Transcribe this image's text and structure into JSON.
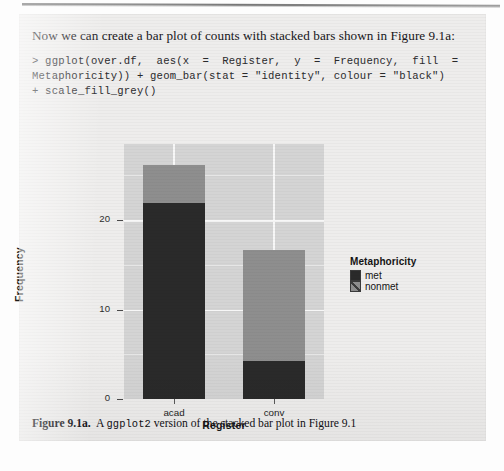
{
  "page": {
    "prose_text": "Now we can create a bar plot of counts with stacked bars shown in Figure 9.1a:",
    "code_lines": [
      "> ggplot(over.df,  aes(x  =  Register,  y  =  Frequency,  fill  =",
      "Metaphoricity)) + geom_bar(stat = \"identity\", colour = \"black\")",
      "+ scale_fill_grey()"
    ],
    "caption": {
      "label": "Figure 9.1a.",
      "text_before": "A ",
      "mono": "ggplot2",
      "text_after": " version of the stacked bar plot in Figure 9.1"
    }
  },
  "chart_data": {
    "type": "bar",
    "stacked": true,
    "title": "",
    "xlabel": "Register",
    "ylabel": "Frequency",
    "categories": [
      "acad",
      "conv"
    ],
    "yticks": [
      0,
      10,
      20
    ],
    "ylim": [
      0,
      28.5
    ],
    "grid": true,
    "legend_title": "Metaphoricity",
    "legend_position": "right",
    "series": [
      {
        "name": "met",
        "values": [
          21.9,
          4.3
        ],
        "color": "#2a2a2a"
      },
      {
        "name": "nonmet",
        "values": [
          4.3,
          12.4
        ],
        "color": "#8e8e8e"
      }
    ],
    "totals": [
      26.2,
      16.7
    ],
    "panel_bg": "#d4d4d4",
    "gridline_color": "#f7f7f7"
  }
}
